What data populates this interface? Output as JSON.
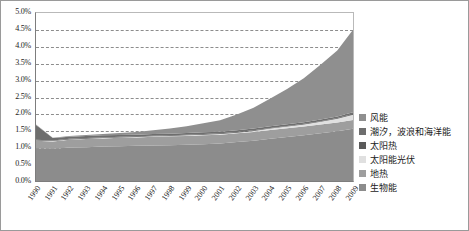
{
  "chart_data": {
    "type": "area",
    "stacked": true,
    "title": "",
    "xlabel": "",
    "ylabel": "",
    "ylim": [
      0,
      5.0
    ],
    "ytick_labels": [
      "0.0%",
      "0.5%",
      "1.0%",
      "1.5%",
      "2.0%",
      "2.5%",
      "3.0%",
      "3.5%",
      "4.0%",
      "4.5%",
      "5.0%"
    ],
    "ytick_values": [
      0.0,
      0.5,
      1.0,
      1.5,
      2.0,
      2.5,
      3.0,
      3.5,
      4.0,
      4.5,
      5.0
    ],
    "grid": "horizontal-dashed",
    "legend_position": "right",
    "categories": [
      "1990",
      "1991",
      "1992",
      "1993",
      "1994",
      "1995",
      "1996",
      "1997",
      "1998",
      "1999",
      "2000",
      "2001",
      "2002",
      "2003",
      "2004",
      "2005",
      "2006",
      "2007",
      "2008",
      "2009"
    ],
    "series": [
      {
        "name": "生物能",
        "color": "#8c8c8c",
        "values": [
          1.0,
          0.98,
          1.02,
          1.03,
          1.05,
          1.06,
          1.07,
          1.08,
          1.09,
          1.1,
          1.12,
          1.14,
          1.18,
          1.22,
          1.28,
          1.33,
          1.38,
          1.44,
          1.5,
          1.58
        ]
      },
      {
        "name": "地热",
        "color": "#9e9e9e",
        "values": [
          0.22,
          0.22,
          0.23,
          0.24,
          0.24,
          0.25,
          0.25,
          0.26,
          0.26,
          0.26,
          0.26,
          0.26,
          0.26,
          0.26,
          0.26,
          0.26,
          0.26,
          0.26,
          0.26,
          0.26
        ]
      },
      {
        "name": "太阳能光伏",
        "color": "#e0e0e0",
        "values": [
          0.01,
          0.01,
          0.01,
          0.01,
          0.01,
          0.01,
          0.01,
          0.01,
          0.01,
          0.02,
          0.02,
          0.02,
          0.02,
          0.03,
          0.04,
          0.05,
          0.06,
          0.08,
          0.11,
          0.16
        ]
      },
      {
        "name": "太阳热",
        "color": "#5a5a5a",
        "values": [
          0.02,
          0.02,
          0.02,
          0.02,
          0.02,
          0.02,
          0.02,
          0.02,
          0.02,
          0.02,
          0.02,
          0.02,
          0.02,
          0.02,
          0.02,
          0.02,
          0.02,
          0.02,
          0.02,
          0.02
        ]
      },
      {
        "name": "潮汐，波浪和海洋能",
        "color": "#6e6e6e",
        "values": [
          0.44,
          0.07,
          0.06,
          0.06,
          0.06,
          0.05,
          0.05,
          0.05,
          0.05,
          0.05,
          0.05,
          0.05,
          0.05,
          0.05,
          0.05,
          0.05,
          0.05,
          0.05,
          0.05,
          0.05
        ]
      },
      {
        "name": "风能",
        "color": "#8f8f8f",
        "values": [
          0.01,
          0.01,
          0.02,
          0.03,
          0.04,
          0.06,
          0.08,
          0.11,
          0.15,
          0.2,
          0.27,
          0.34,
          0.47,
          0.62,
          0.82,
          1.04,
          1.3,
          1.62,
          1.95,
          2.47
        ]
      }
    ],
    "totals": [
      1.7,
      1.31,
      1.36,
      1.39,
      1.42,
      1.45,
      1.48,
      1.53,
      1.58,
      1.65,
      1.74,
      1.83,
      2.0,
      2.2,
      2.47,
      2.75,
      3.07,
      3.47,
      3.89,
      4.54
    ]
  },
  "legend": {
    "items": [
      {
        "label": "风能",
        "color": "#8f8f8f"
      },
      {
        "label": "潮汐，波浪和海洋能",
        "color": "#6e6e6e"
      },
      {
        "label": "太阳热",
        "color": "#5a5a5a"
      },
      {
        "label": "太阳能光伏",
        "color": "#e0e0e0"
      },
      {
        "label": "地热",
        "color": "#9e9e9e"
      },
      {
        "label": "生物能",
        "color": "#8c8c8c"
      }
    ]
  }
}
